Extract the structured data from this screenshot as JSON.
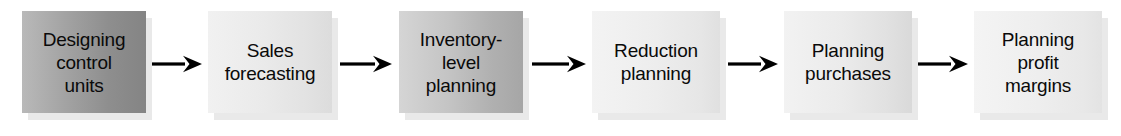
{
  "diagram": {
    "orientation": "left-to-right",
    "background_color": "#ffffff",
    "arrow_color": "#000000",
    "text_color": "#0a0a0a",
    "nodes": [
      {
        "id": "designing-control-units",
        "label": "Designing\ncontrol\nunits",
        "fill": "dark",
        "x": 22,
        "width": 124
      },
      {
        "id": "sales-forecasting",
        "label": "Sales\nforecasting",
        "fill": "light",
        "x": 208,
        "width": 124
      },
      {
        "id": "inventory-level-planning",
        "label": "Inventory-\nlevel\nplanning",
        "fill": "medium",
        "x": 399,
        "width": 124
      },
      {
        "id": "reduction-planning",
        "label": "Reduction\nplanning",
        "fill": "pale",
        "x": 592,
        "width": 128
      },
      {
        "id": "planning-purchases",
        "label": "Planning\npurchases",
        "fill": "pale2",
        "x": 784,
        "width": 128
      },
      {
        "id": "planning-profit-margins",
        "label": "Planning\nprofit\nmargins",
        "fill": "pale3",
        "x": 974,
        "width": 128
      }
    ],
    "connectors": [
      {
        "id": "arrow-1",
        "from": "designing-control-units",
        "to": "sales-forecasting",
        "x": 152,
        "width": 50
      },
      {
        "id": "arrow-2",
        "from": "sales-forecasting",
        "to": "inventory-level-planning",
        "x": 340,
        "width": 52
      },
      {
        "id": "arrow-3",
        "from": "inventory-level-planning",
        "to": "reduction-planning",
        "x": 532,
        "width": 54
      },
      {
        "id": "arrow-4",
        "from": "reduction-planning",
        "to": "planning-purchases",
        "x": 728,
        "width": 50
      },
      {
        "id": "arrow-5",
        "from": "planning-purchases",
        "to": "planning-profit-margins",
        "x": 918,
        "width": 50
      }
    ]
  }
}
